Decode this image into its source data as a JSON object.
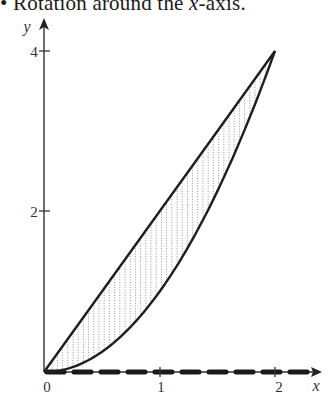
{
  "caption": {
    "bullet": "•",
    "text_before": "Rotation around the ",
    "axis_var": "x",
    "text_after": "-axis."
  },
  "chart_data": {
    "type": "area",
    "title": "Rotation around the x-axis.",
    "xlabel": "x",
    "ylabel": "y",
    "x_ticks": [
      "0",
      "1",
      "2"
    ],
    "y_ticks": [
      "2",
      "4"
    ],
    "xlim": [
      0,
      2.25
    ],
    "ylim": [
      0,
      4.4
    ],
    "grid": false,
    "legend": null,
    "series": [
      {
        "name": "upper line y = 2x",
        "style": "solid",
        "x": [
          0,
          0.5,
          1,
          1.5,
          2
        ],
        "y": [
          0,
          1,
          2,
          3,
          4
        ]
      },
      {
        "name": "lower curve y = x^2",
        "style": "solid",
        "x": [
          0,
          0.5,
          1,
          1.5,
          2
        ],
        "y": [
          0,
          0.25,
          1,
          2.25,
          4
        ]
      }
    ],
    "shaded_region": {
      "between": [
        "y = 2x",
        "y = x^2"
      ],
      "x_range": [
        0,
        2
      ],
      "pattern": "vertical dotted lines"
    },
    "rotation_axis": {
      "axis": "x",
      "style": "thick dashed",
      "x_range": [
        0,
        2.2
      ]
    },
    "intersection_points": [
      [
        0,
        0
      ],
      [
        2,
        4
      ]
    ]
  },
  "colors": {
    "ink": "#1e1e1e",
    "axis": "#333333",
    "hatch": "#8a8a8a",
    "background": "#ffffff"
  }
}
